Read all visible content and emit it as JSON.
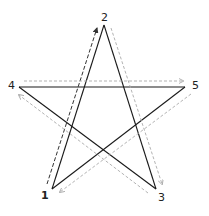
{
  "diagram": {
    "labels": [
      {
        "id": "1",
        "text": "1"
      },
      {
        "id": "2",
        "text": "2"
      },
      {
        "id": "3",
        "text": "3"
      },
      {
        "id": "4",
        "text": "4"
      },
      {
        "id": "5",
        "text": "5"
      }
    ],
    "stroke_order": [
      "1",
      "2",
      "3",
      "4",
      "5",
      "1"
    ],
    "colors": {
      "star_line": "#1a1a1a",
      "first_arrow": "#333333",
      "other_arrows": "#aaaaaa"
    }
  }
}
